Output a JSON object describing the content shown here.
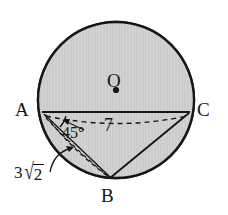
{
  "figure": {
    "type": "circle-geometry-diagram",
    "background_color": "#ffffff",
    "fill_color": "#cccccc",
    "stroke_color": "#161616"
  },
  "points": {
    "A": {
      "label": "A",
      "x": 42,
      "y": 112
    },
    "B": {
      "label": "B",
      "x": 110,
      "y": 178
    },
    "C": {
      "label": "C",
      "x": 190,
      "y": 112
    },
    "O": {
      "label": "O",
      "x": 116,
      "y": 90
    }
  },
  "measures": {
    "side_ac": "7",
    "angle_at_a": "45°",
    "side_ab_coefficient": "3",
    "side_ab_radicand": "2",
    "side_ab_full": "3√2"
  },
  "icons": {
    "center_dot": "center-dot-icon",
    "angle_arc": "angle-arc-icon",
    "leader_arrow": "leader-arrow-icon"
  }
}
